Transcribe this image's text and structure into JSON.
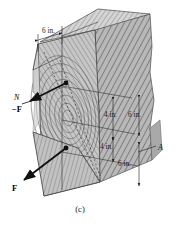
{
  "figure": {
    "caption": "(c)",
    "background_color": "#ffffff",
    "ink_color": "#1a1a1a",
    "block_face_color": "#b4b4b4",
    "block_top_color": "#d8d8d8",
    "cut_plane_color": "#c0c0c0",
    "grain_color": "#6e6e6e"
  },
  "dimensions": [
    {
      "id": "top-width",
      "text": "6 in.",
      "orientation": "horizontal",
      "position": "top-left"
    },
    {
      "id": "upper-depth",
      "text": "4 in.",
      "orientation": "vertical",
      "position": "middle-inner"
    },
    {
      "id": "right-upper",
      "text": "6 in.",
      "orientation": "vertical",
      "position": "middle-right"
    },
    {
      "id": "lower-depth",
      "text": "4 in.",
      "orientation": "vertical",
      "position": "lower-inner"
    },
    {
      "id": "right-lower",
      "text": "6 in.",
      "orientation": "vertical",
      "position": "lower-right"
    }
  ],
  "labels": {
    "normal_axis": "N",
    "force_negative": "−F",
    "force_positive": "F",
    "section_point": "A"
  }
}
